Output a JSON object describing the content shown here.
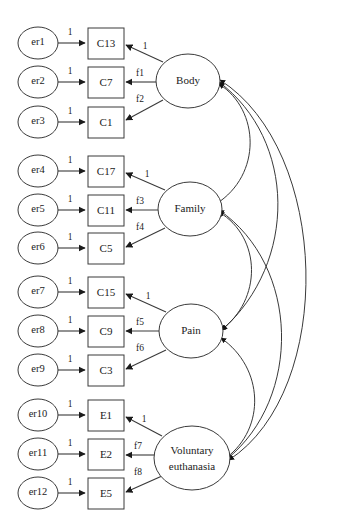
{
  "diagram": {
    "type": "path-diagram",
    "background_color": "#ffffff",
    "stroke_color": "#3a3a3a",
    "text_color": "#1b1b1b",
    "errors": [
      {
        "id": "er1",
        "label": "er1"
      },
      {
        "id": "er2",
        "label": "er2"
      },
      {
        "id": "er3",
        "label": "er3"
      },
      {
        "id": "er4",
        "label": "er4"
      },
      {
        "id": "er5",
        "label": "er5"
      },
      {
        "id": "er6",
        "label": "er6"
      },
      {
        "id": "er7",
        "label": "er7"
      },
      {
        "id": "er8",
        "label": "er8"
      },
      {
        "id": "er9",
        "label": "er9"
      },
      {
        "id": "er10",
        "label": "er10"
      },
      {
        "id": "er11",
        "label": "er11"
      },
      {
        "id": "er12",
        "label": "er12"
      }
    ],
    "indicators": [
      {
        "id": "C13",
        "label": "C13"
      },
      {
        "id": "C7",
        "label": "C7"
      },
      {
        "id": "C1",
        "label": "C1"
      },
      {
        "id": "C17",
        "label": "C17"
      },
      {
        "id": "C11",
        "label": "C11"
      },
      {
        "id": "C5",
        "label": "C5"
      },
      {
        "id": "C15",
        "label": "C15"
      },
      {
        "id": "C9",
        "label": "C9"
      },
      {
        "id": "C3",
        "label": "C3"
      },
      {
        "id": "E1",
        "label": "E1"
      },
      {
        "id": "E2",
        "label": "E2"
      },
      {
        "id": "E5",
        "label": "E5"
      }
    ],
    "factors": [
      {
        "id": "body",
        "label": "Body",
        "line2": ""
      },
      {
        "id": "family",
        "label": "Family",
        "line2": ""
      },
      {
        "id": "pain",
        "label": "Pain",
        "line2": ""
      },
      {
        "id": "euth",
        "label": "Voluntary",
        "line2": "euthanasia"
      }
    ],
    "error_loadings": [
      {
        "from": "er1",
        "to": "C13",
        "label": "1"
      },
      {
        "from": "er2",
        "to": "C7",
        "label": "1"
      },
      {
        "from": "er3",
        "to": "C1",
        "label": "1"
      },
      {
        "from": "er4",
        "to": "C17",
        "label": "1"
      },
      {
        "from": "er5",
        "to": "C11",
        "label": "1"
      },
      {
        "from": "er6",
        "to": "C5",
        "label": "1"
      },
      {
        "from": "er7",
        "to": "C15",
        "label": "1"
      },
      {
        "from": "er8",
        "to": "C9",
        "label": "1"
      },
      {
        "from": "er9",
        "to": "C3",
        "label": "1"
      },
      {
        "from": "er10",
        "to": "E1",
        "label": "1"
      },
      {
        "from": "er11",
        "to": "E2",
        "label": "1"
      },
      {
        "from": "er12",
        "to": "E5",
        "label": "1"
      }
    ],
    "factor_loadings": [
      {
        "from": "body",
        "to": "C13",
        "label": "1"
      },
      {
        "from": "body",
        "to": "C7",
        "label": "f1"
      },
      {
        "from": "body",
        "to": "C1",
        "label": "f2"
      },
      {
        "from": "family",
        "to": "C17",
        "label": "1"
      },
      {
        "from": "family",
        "to": "C11",
        "label": "f3"
      },
      {
        "from": "family",
        "to": "C5",
        "label": "f4"
      },
      {
        "from": "pain",
        "to": "C15",
        "label": "1"
      },
      {
        "from": "pain",
        "to": "C9",
        "label": "f5"
      },
      {
        "from": "pain",
        "to": "C3",
        "label": "f6"
      },
      {
        "from": "euth",
        "to": "E1",
        "label": "1"
      },
      {
        "from": "euth",
        "to": "E2",
        "label": "f7"
      },
      {
        "from": "euth",
        "to": "E5",
        "label": "f8"
      }
    ],
    "covariances": [
      {
        "between": [
          "body",
          "family"
        ],
        "label": ""
      },
      {
        "between": [
          "body",
          "pain"
        ],
        "label": ""
      },
      {
        "between": [
          "body",
          "euth"
        ],
        "label": ""
      },
      {
        "between": [
          "family",
          "pain"
        ],
        "label": ""
      },
      {
        "between": [
          "family",
          "euth"
        ],
        "label": ""
      },
      {
        "between": [
          "pain",
          "euth"
        ],
        "label": ""
      }
    ]
  }
}
